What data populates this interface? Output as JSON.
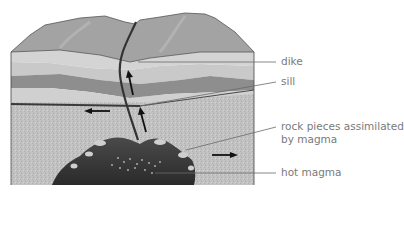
{
  "labels": {
    "dike": "dike",
    "sill": "sill",
    "rock_pieces_line1": "rock pieces assimilated",
    "rock_pieces_line2": "by magma",
    "hot_magma": "hot magma"
  },
  "colors": {
    "background": "#ffffff",
    "surface": "#9a9a9a",
    "light_layer": "#cfcfcf",
    "mid_layer": "#b4b4b4",
    "dark_layer": "#8a8a8a",
    "lower_rock": "#bdbdbd",
    "magma": "#3a3a3a",
    "arrow": "#111111",
    "leader_line": "#6a6a6a",
    "label_text": "#7a7a7a"
  }
}
